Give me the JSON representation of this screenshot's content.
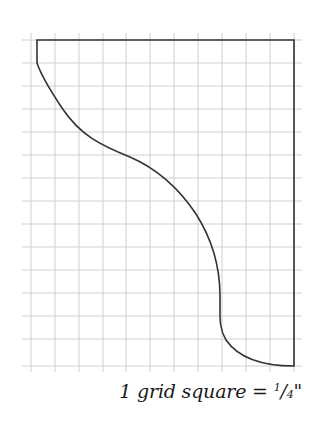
{
  "diagram": {
    "grid": {
      "columns": 11,
      "rows": 14,
      "x_start": 31,
      "x_spacing": 23.9,
      "y_start": 40,
      "y_spacing": 23.3,
      "line_color": "#c8c8c8"
    },
    "outline_color": "#333333",
    "shape": "Profile cutout: flat top edge, straight right edge, left side descending with a convex curve then S-curve into a short vertical segment then concave curve to bottom-right corner"
  },
  "caption": {
    "prefix": "1 grid square = ",
    "numerator": "1",
    "slash": "/",
    "denominator": "4",
    "unit": "\"",
    "full_text": "1 grid square = 1/4\""
  }
}
